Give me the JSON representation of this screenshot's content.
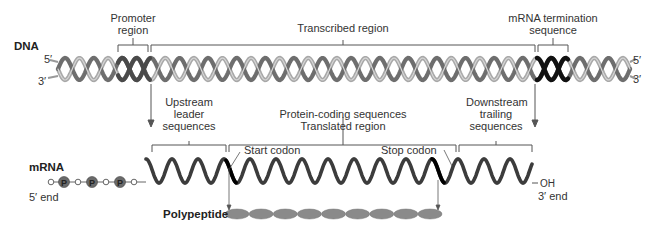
{
  "dna": {
    "label": "DNA",
    "top_end": "5′",
    "bottom_end": "3′",
    "right_top_end": "5′",
    "right_bottom_end": "3′",
    "regions": [
      {
        "name": "promoter",
        "label_line1": "Promoter",
        "label_line2": "region"
      },
      {
        "name": "transcribed",
        "label_line1": "Transcribed region"
      },
      {
        "name": "termination",
        "label_line1": "mRNA termination",
        "label_line2": "sequence"
      }
    ],
    "colors": {
      "strand_light": "#a8a8a8",
      "strand_dark": "#6e6e6e",
      "promoter": "#4a4a4a",
      "terminator": "#111111"
    }
  },
  "mrna": {
    "label": "mRNA",
    "five_end": "5′ end",
    "three_end": "3′ end",
    "oh_label": "OH",
    "phosphate_label": "P",
    "regions": [
      {
        "name": "upstream",
        "line1": "Upstream",
        "line2": "leader",
        "line3": "sequences"
      },
      {
        "name": "coding",
        "line1": "Protein-coding sequences",
        "line2": "Translated region"
      },
      {
        "name": "downstream",
        "line1": "Downstream",
        "line2": "trailing",
        "line3": "sequences"
      }
    ],
    "start_codon": "Start codon",
    "stop_codon": "Stop codon",
    "colors": {
      "strand": "#3c3c3c",
      "phosphate": "#6a6a6a"
    }
  },
  "polypeptide": {
    "label": "Polypeptide",
    "bead_count": 9,
    "color": "#8a8a8a"
  }
}
